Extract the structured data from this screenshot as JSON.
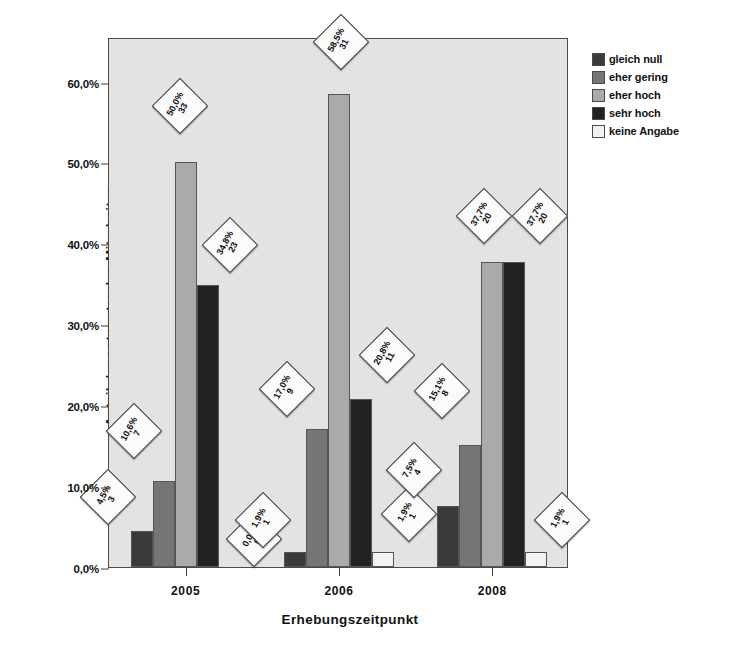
{
  "chart_data": {
    "type": "bar",
    "title": "",
    "xlabel": "Erhebungszeitpunkt",
    "ylabel": "Anteil der antwortenden Mitarbeiter",
    "categories": [
      "2005",
      "2006",
      "2008"
    ],
    "ylim": [
      0,
      65.5
    ],
    "ytick_labels": [
      "0,0%",
      "10,0%",
      "20,0%",
      "30,0%",
      "40,0%",
      "50,0%",
      "60,0%"
    ],
    "ytick_values": [
      0,
      10,
      20,
      30,
      40,
      50,
      60
    ],
    "grid": false,
    "legend_position": "right",
    "series": [
      {
        "name": "gleich null",
        "color": "#3a3a3a",
        "values": [
          4.5,
          1.9,
          7.5
        ],
        "labels": [
          "4,5%",
          "1,9%",
          "7,5%"
        ],
        "counts": [
          "3",
          "1",
          "4"
        ]
      },
      {
        "name": "eher gering",
        "color": "#757575",
        "values": [
          10.6,
          17.0,
          15.1
        ],
        "labels": [
          "10,6%",
          "17,0%",
          "15,1%"
        ],
        "counts": [
          "7",
          "9",
          "8"
        ]
      },
      {
        "name": "eher hoch",
        "color": "#aaaaaa",
        "values": [
          50.0,
          58.5,
          37.7
        ],
        "labels": [
          "50,0%",
          "58,5%",
          "37,7%"
        ],
        "counts": [
          "33",
          "31",
          "20"
        ]
      },
      {
        "name": "sehr hoch",
        "color": "#222222",
        "values": [
          34.8,
          20.8,
          37.7
        ],
        "labels": [
          "34,8%",
          "20,8%",
          "37,7%"
        ],
        "counts": [
          "23",
          "11",
          "20"
        ]
      },
      {
        "name": "keine Angabe",
        "color": "#f2f2f2",
        "values": [
          0.0,
          1.9,
          1.9
        ],
        "labels": [
          "0,0%",
          "1,9%",
          "1,9%"
        ],
        "counts": [
          "0",
          "1",
          "1"
        ]
      }
    ]
  },
  "legend": {
    "items": [
      {
        "label": "gleich null",
        "color": "#3a3a3a"
      },
      {
        "label": "eher gering",
        "color": "#757575"
      },
      {
        "label": "eher hoch",
        "color": "#aaaaaa"
      },
      {
        "label": "sehr hoch",
        "color": "#222222"
      },
      {
        "label": "keine Angabe",
        "color": "#f2f2f2"
      }
    ]
  },
  "colors": {
    "plot_background": "#e3e3e3",
    "frame": "#4a4a4a",
    "text": "#111111",
    "label_box": "#fbfbfb"
  }
}
